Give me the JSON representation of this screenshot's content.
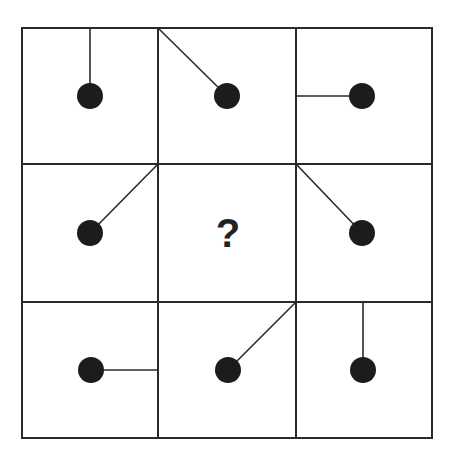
{
  "puzzle": {
    "type": "3x3 pattern matrix",
    "missing_cell_label": "?",
    "colors": {
      "line": "#2a2a2a",
      "dot": "#1c1c1c",
      "background": "#ffffff"
    },
    "cells": [
      {
        "row": 0,
        "col": 0,
        "line_to": "top-center"
      },
      {
        "row": 0,
        "col": 1,
        "line_to": "top-left-corner"
      },
      {
        "row": 0,
        "col": 2,
        "line_to": "left-center"
      },
      {
        "row": 1,
        "col": 0,
        "line_to": "top-right-corner"
      },
      {
        "row": 1,
        "col": 1,
        "line_to": "missing"
      },
      {
        "row": 1,
        "col": 2,
        "line_to": "top-left-corner"
      },
      {
        "row": 2,
        "col": 0,
        "line_to": "right-center"
      },
      {
        "row": 2,
        "col": 1,
        "line_to": "top-right-corner"
      },
      {
        "row": 2,
        "col": 2,
        "line_to": "top-center"
      }
    ]
  }
}
